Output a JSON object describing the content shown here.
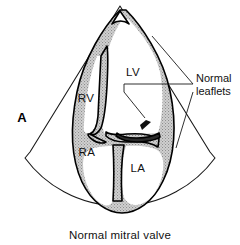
{
  "figure": {
    "panel_letter": "A",
    "caption": "Normal mitral valve",
    "view_type": "apical four-chamber echocardiographic sector scan",
    "background_color": "#ffffff",
    "ink_color": "#111111",
    "myocardium_fill_color": "#c8c8c8"
  },
  "chamber_labels": [
    {
      "id": "lv",
      "label": "LV",
      "full_name": "left ventricle",
      "x": 133,
      "y": 76
    },
    {
      "id": "rv",
      "label": "RV",
      "full_name": "right ventricle",
      "x": 86,
      "y": 102
    },
    {
      "id": "ra",
      "label": "RA",
      "full_name": "right atrium",
      "x": 87,
      "y": 156
    },
    {
      "id": "la",
      "label": "LA",
      "full_name": "left atrium",
      "x": 138,
      "y": 172
    }
  ],
  "callouts": [
    {
      "id": "normal-leaflets",
      "lines": [
        "Normal",
        "leaflets"
      ],
      "line1": "Normal",
      "line2": "leaflets",
      "text_x": 198,
      "text_y": 89,
      "points_to": "mitral valve leaflets"
    }
  ],
  "panel_letter_position": {
    "x": 22,
    "y": 122
  },
  "caption_position": {
    "x": 120,
    "y": 238
  }
}
